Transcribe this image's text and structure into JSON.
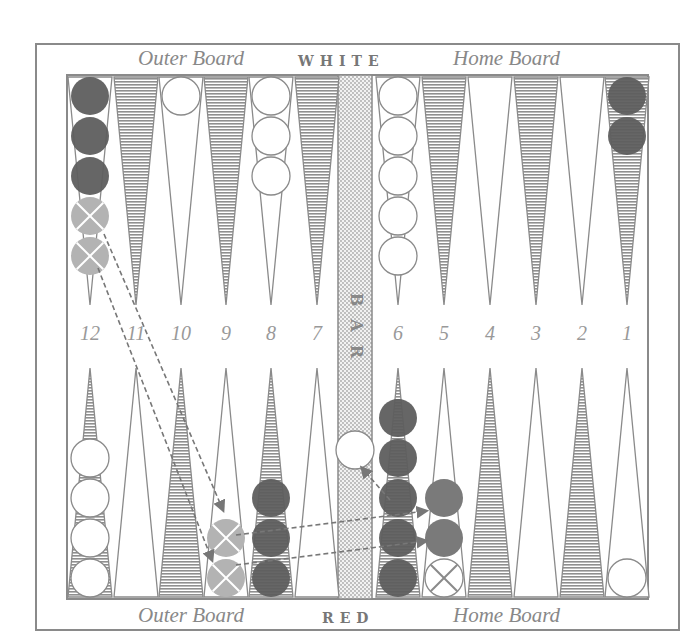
{
  "labels": {
    "top_left": "Outer Board",
    "top_center": "WHITE",
    "top_right": "Home Board",
    "bottom_left": "Outer Board",
    "bottom_center": "RED",
    "bottom_right": "Home Board",
    "bar": [
      "B",
      "A",
      "R"
    ]
  },
  "point_numbers": [
    "12",
    "11",
    "10",
    "9",
    "8",
    "7",
    "6",
    "5",
    "4",
    "3",
    "2",
    "1"
  ],
  "colors": {
    "frame": "#8a8a8a",
    "dark_checker": "#5e5e5e",
    "medium_checker": "#7a7a7a",
    "ghost_checker": "#b3b3b3",
    "white_checker": "#ffffff",
    "shaded_point": "#9a9a9a",
    "bar_fill": "#d4d4d4"
  },
  "checkers": {
    "top": [
      {
        "point": 12,
        "dark": 3,
        "ghost_x": 2
      },
      {
        "point": 10,
        "white": 1
      },
      {
        "point": 8,
        "white": 3
      },
      {
        "point": 6,
        "white": 5
      },
      {
        "point": 1,
        "dark": 2
      }
    ],
    "bottom": [
      {
        "point": 12,
        "white": 4
      },
      {
        "point": 9,
        "ghost_x": 2
      },
      {
        "point": 8,
        "dark": 3
      },
      {
        "point": 6,
        "dark": 5
      },
      {
        "point": 5,
        "medium": 2,
        "empty_x": 1
      },
      {
        "point": 1,
        "white": 1
      },
      {
        "point": "bar",
        "white": 1
      }
    ]
  },
  "moves": [
    {
      "from": "top-12",
      "to": "bottom-9 upper"
    },
    {
      "from": "top-12",
      "to": "bottom-9 lower"
    },
    {
      "from": "bottom-9 upper",
      "to": "bottom-5 upper"
    },
    {
      "from": "bottom-9 lower",
      "to": "bottom-5 lower"
    },
    {
      "from": "bottom-6",
      "to": "bar"
    }
  ]
}
